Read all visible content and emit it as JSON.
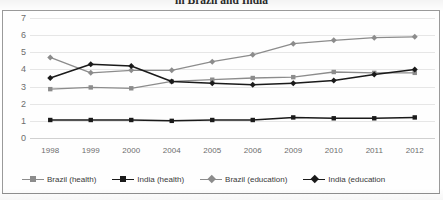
{
  "chart_data": {
    "type": "line",
    "title": "in Brazil and India",
    "xlabel": "",
    "ylabel": "",
    "ylim": [
      0,
      7
    ],
    "ytick_step": 1,
    "yticks": [
      "7",
      "6",
      "5",
      "4",
      "3",
      "2",
      "1",
      "0"
    ],
    "grid": true,
    "legend_position": "bottom",
    "categories": [
      "1998",
      "1999",
      "2000",
      "2004",
      "2005",
      "2006",
      "2009",
      "2010",
      "2011",
      "2012"
    ],
    "series": [
      {
        "name": "Brazil (health)",
        "marker": "square",
        "color": "#8c8c8c",
        "values": [
          2.85,
          2.95,
          2.9,
          3.3,
          3.4,
          3.5,
          3.55,
          3.85,
          3.8,
          3.8
        ]
      },
      {
        "name": "India (health)",
        "marker": "square",
        "color": "#1a1a1a",
        "values": [
          1.05,
          1.05,
          1.05,
          1.0,
          1.05,
          1.05,
          1.2,
          1.15,
          1.15,
          1.2
        ]
      },
      {
        "name": "Brazil (education)",
        "marker": "diamond",
        "color": "#8c8c8c",
        "values": [
          4.7,
          3.8,
          3.95,
          3.95,
          4.45,
          4.85,
          5.5,
          5.7,
          5.85,
          5.9
        ]
      },
      {
        "name": "India (education",
        "marker": "diamond",
        "color": "#1a1a1a",
        "values": [
          3.5,
          4.3,
          4.2,
          3.3,
          3.2,
          3.1,
          3.2,
          3.35,
          3.7,
          4.0
        ]
      }
    ]
  },
  "legend": {
    "items": [
      {
        "label": "Brazil (health)"
      },
      {
        "label": "India (health)"
      },
      {
        "label": "Brazil (education)"
      },
      {
        "label": "India (education"
      }
    ]
  }
}
